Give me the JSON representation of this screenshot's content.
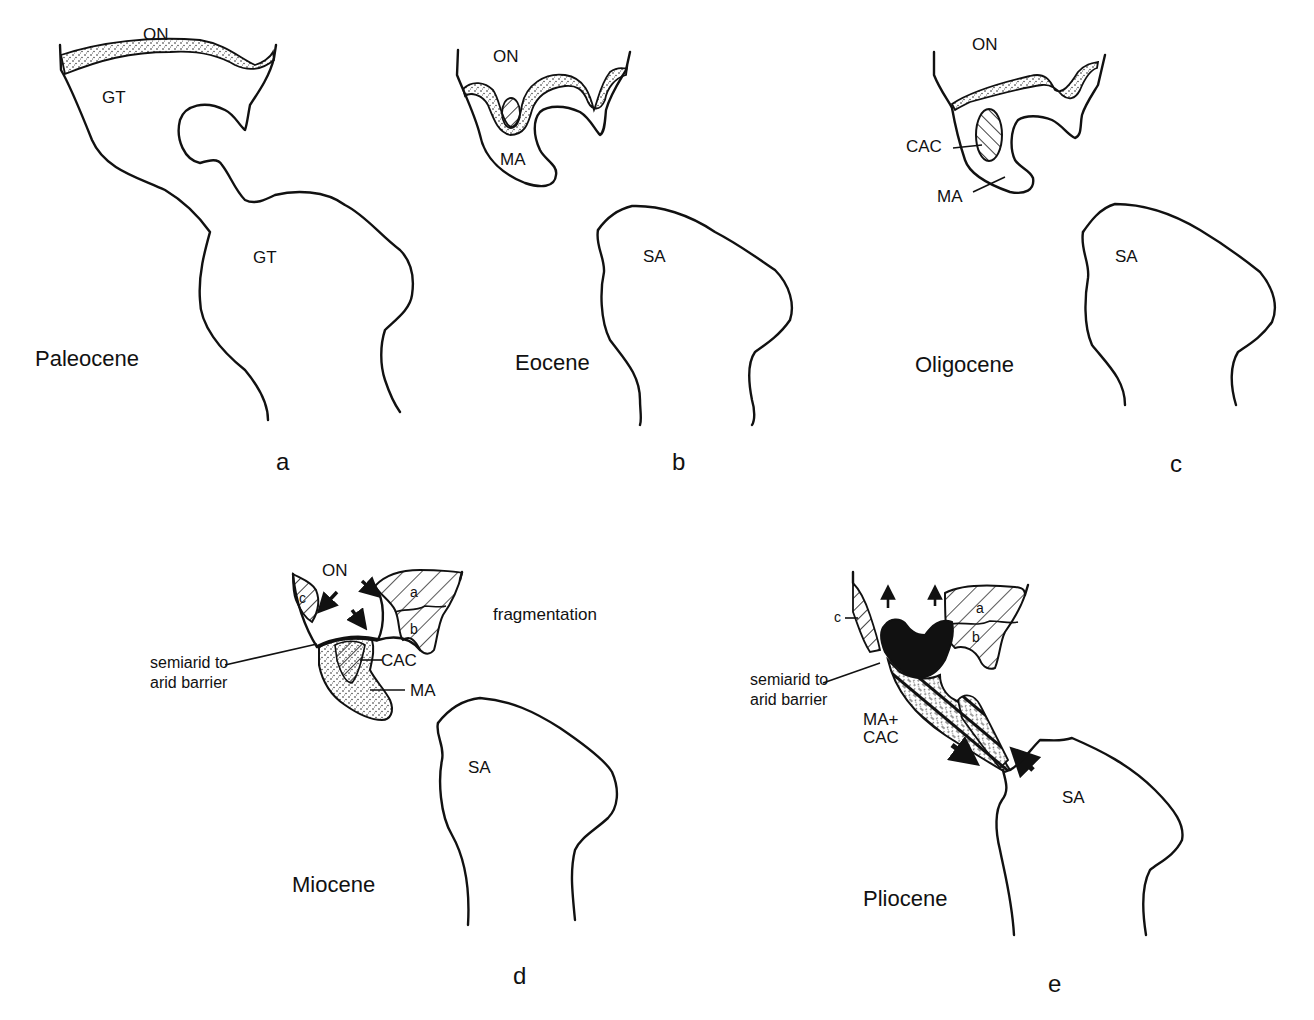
{
  "figure": {
    "panels": [
      {
        "id": "a",
        "letter": "a",
        "epoch": "Paleocene",
        "regions": [
          "ON",
          "GT",
          "GT"
        ]
      },
      {
        "id": "b",
        "letter": "b",
        "epoch": "Eocene",
        "regions": [
          "ON",
          "MA",
          "SA"
        ]
      },
      {
        "id": "c",
        "letter": "c",
        "epoch": "Oligocene",
        "regions": [
          "ON",
          "CAC",
          "MA",
          "SA"
        ]
      },
      {
        "id": "d",
        "letter": "d",
        "epoch": "Miocene",
        "regions": [
          "ON",
          "c",
          "a",
          "b",
          "CAC",
          "MA",
          "SA"
        ],
        "annotations": [
          "fragmentation",
          "semiarid to",
          "arid barrier"
        ]
      },
      {
        "id": "e",
        "letter": "e",
        "epoch": "Pliocene",
        "regions": [
          "c",
          "a",
          "b",
          "MA+",
          "CAC",
          "SA"
        ],
        "annotations": [
          "semiarid to",
          "arid barrier"
        ]
      }
    ]
  }
}
